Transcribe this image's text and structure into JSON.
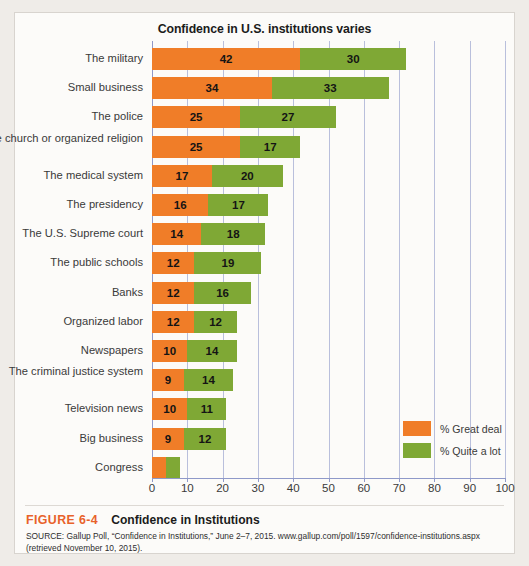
{
  "figure": {
    "number": "FIGURE 6-4",
    "caption": "Confidence in Institutions",
    "source": "SOURCE: Gallup Poll, “Confidence in Institutions,” June 2–7, 2015. www.gallup.com/poll/1597/confidence-institutions.aspx (retrieved November 10, 2015)."
  },
  "colors": {
    "great_deal": "#f07d28",
    "quite_a_lot": "#7fa835",
    "gridline": "#b9bfdc",
    "accent": "#e8622a",
    "panel_background": "#fcfbf9"
  },
  "legend": {
    "position": "bottom-right",
    "items": [
      {
        "label": "% Great deal",
        "color": "#f07d28",
        "swatch": "great"
      },
      {
        "label": "% Quite a lot",
        "color": "#7fa835",
        "swatch": "quite"
      }
    ]
  },
  "chart_data": {
    "type": "bar",
    "orientation": "horizontal",
    "stacked": true,
    "title": "Confidence in U.S. institutions varies",
    "xlabel": "",
    "ylabel": "",
    "xlim": [
      0,
      100
    ],
    "xticks": [
      0,
      10,
      20,
      30,
      40,
      50,
      60,
      70,
      80,
      90,
      100
    ],
    "xtick_labels": [
      "0",
      "10",
      "20",
      "30",
      "40",
      "50",
      "60",
      "70",
      "80",
      "90",
      "100"
    ],
    "grid": true,
    "grid_axis": "x",
    "legend_position": "bottom-right",
    "categories": [
      "The military",
      "Small business",
      "The police",
      "The church or organized religion",
      "The medical system",
      "The presidency",
      "The U.S. Supreme court",
      "The public schools",
      "Banks",
      "Organized labor",
      "Newspapers",
      "The criminal justice system",
      "Television news",
      "Big business",
      "Congress"
    ],
    "series": [
      {
        "name": "% Great deal",
        "color": "#f07d28",
        "values": [
          42,
          34,
          25,
          25,
          17,
          16,
          14,
          12,
          12,
          12,
          10,
          9,
          10,
          9,
          4
        ],
        "labels": [
          "42",
          "34",
          "25",
          "25",
          "17",
          "16",
          "14",
          "12",
          "12",
          "12",
          "10",
          "9",
          "10",
          "9",
          ""
        ]
      },
      {
        "name": "% Quite a lot",
        "color": "#7fa835",
        "values": [
          30,
          33,
          27,
          17,
          20,
          17,
          18,
          19,
          16,
          12,
          14,
          14,
          11,
          12,
          4
        ],
        "labels": [
          "30",
          "33",
          "27",
          "17",
          "20",
          "17",
          "18",
          "19",
          "16",
          "12",
          "14",
          "14",
          "11",
          "12",
          ""
        ]
      }
    ],
    "totals": [
      72,
      67,
      52,
      42,
      37,
      33,
      32,
      31,
      28,
      24,
      24,
      23,
      21,
      21,
      8
    ]
  }
}
